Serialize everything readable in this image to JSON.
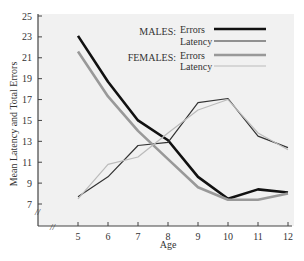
{
  "chart_data": {
    "type": "line",
    "title": "",
    "xlabel": "Age",
    "ylabel": "Mean Latency and Total Errors",
    "x": [
      5,
      6,
      7,
      8,
      9,
      10,
      11,
      12
    ],
    "xlim": [
      3.7,
      12
    ],
    "ylim": [
      5,
      25
    ],
    "yticks": [
      7,
      9,
      11,
      13,
      15,
      17,
      19,
      21,
      23,
      25
    ],
    "xticks": [
      5,
      6,
      7,
      8,
      9,
      10,
      11,
      12
    ],
    "axis_break": true,
    "grid": false,
    "legend_position": "top-right",
    "legend_groups": [
      {
        "label": "MALES:",
        "entries": [
          "Errors",
          "Latency"
        ]
      },
      {
        "label": "FEMALES:",
        "entries": [
          "Errors",
          "Latency"
        ]
      }
    ],
    "series": [
      {
        "name": "Males Errors",
        "group": "MALES:",
        "entry": "Errors",
        "color": "#111111",
        "style": "thick",
        "values": [
          23.1,
          18.7,
          15.0,
          13.1,
          9.6,
          7.5,
          8.4,
          8.1
        ]
      },
      {
        "name": "Males Latency",
        "group": "MALES:",
        "entry": "Latency",
        "color": "#333333",
        "style": "thin",
        "values": [
          7.7,
          9.6,
          12.6,
          12.9,
          16.7,
          17.1,
          13.5,
          12.4
        ]
      },
      {
        "name": "Females Errors",
        "group": "FEMALES:",
        "entry": "Errors",
        "color": "#999999",
        "style": "thick",
        "values": [
          21.6,
          17.3,
          14.0,
          11.3,
          8.6,
          7.4,
          7.4,
          8.0
        ]
      },
      {
        "name": "Females Latency",
        "group": "FEMALES:",
        "entry": "Latency",
        "color": "#bbbbbb",
        "style": "thin",
        "values": [
          7.5,
          10.8,
          11.5,
          13.8,
          16.0,
          17.0,
          13.8,
          12.2
        ]
      }
    ]
  }
}
